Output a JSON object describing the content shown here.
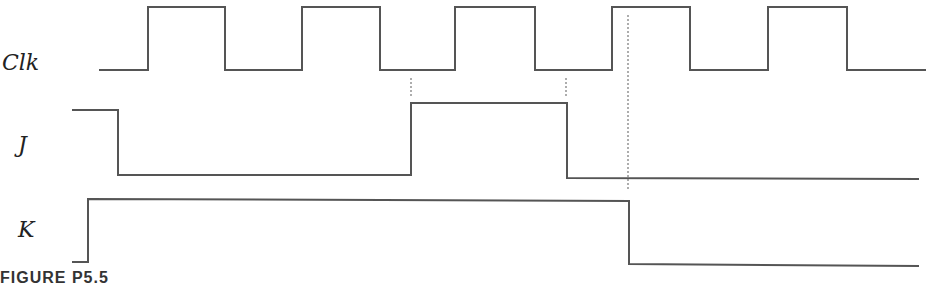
{
  "diagram": {
    "type": "timing-diagram",
    "signals": [
      {
        "name": "Clk",
        "label_pos": {
          "x": 2,
          "y": 54
        },
        "points": [
          [
            99,
            70
          ],
          [
            148,
            70
          ],
          [
            148,
            7
          ],
          [
            225,
            7
          ],
          [
            225,
            70
          ],
          [
            302,
            70
          ],
          [
            302,
            7
          ],
          [
            380,
            7
          ],
          [
            380,
            70
          ],
          [
            455,
            70
          ],
          [
            455,
            7
          ],
          [
            535,
            7
          ],
          [
            535,
            70
          ],
          [
            612,
            70
          ],
          [
            612,
            7
          ],
          [
            690,
            7
          ],
          [
            690,
            70
          ],
          [
            768,
            70
          ],
          [
            768,
            7
          ],
          [
            847,
            7
          ],
          [
            847,
            70
          ],
          [
            926,
            70
          ]
        ]
      },
      {
        "name": "J",
        "label_pos": {
          "x": 18,
          "y": 136
        },
        "points": [
          [
            72,
            110
          ],
          [
            118,
            110
          ],
          [
            118,
            175
          ],
          [
            411,
            175
          ],
          [
            411,
            103
          ],
          [
            567,
            103
          ],
          [
            567,
            178
          ],
          [
            919,
            179
          ]
        ]
      },
      {
        "name": "K",
        "label_pos": {
          "x": 18,
          "y": 221
        },
        "points": [
          [
            72,
            262
          ],
          [
            88,
            262
          ],
          [
            88,
            199
          ],
          [
            629,
            201
          ],
          [
            629,
            264
          ],
          [
            919,
            266
          ]
        ]
      }
    ],
    "dotted_guides": [
      {
        "x": 411,
        "y1": 78,
        "y2": 96
      },
      {
        "x": 566,
        "y1": 78,
        "y2": 96
      },
      {
        "x": 628,
        "y1": 15,
        "y2": 190
      }
    ],
    "caption": "FIGURE P5.5",
    "stroke_color": "#555555",
    "guide_color": "#777777"
  }
}
